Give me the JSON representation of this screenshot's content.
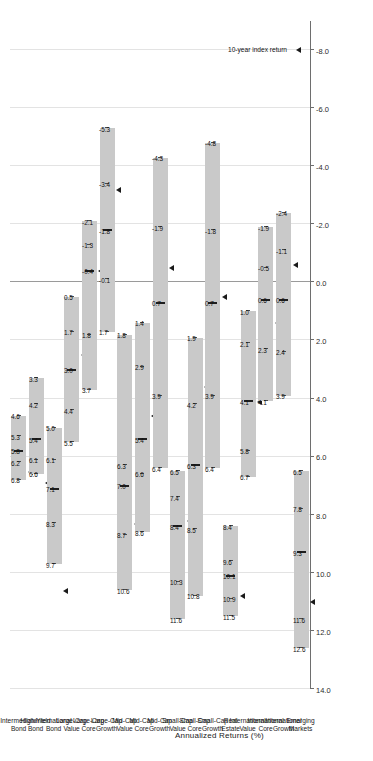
{
  "chart_data": {
    "type": "box",
    "title": "",
    "xlabel": "",
    "ylabel": "Annualized Returns (%)",
    "ylim": [
      -9.0,
      14.0
    ],
    "grid": true,
    "tick_labels": [
      "14.0",
      "12.0",
      "10.0",
      "8.0",
      "6.0",
      "4.0",
      "2.0",
      "0.0",
      "-2.0",
      "-4.0",
      "-6.0",
      "-8.0"
    ],
    "tick_values": [
      14.0,
      12.0,
      10.0,
      8.0,
      6.0,
      4.0,
      2.0,
      0.0,
      -2.0,
      -4.0,
      -6.0,
      -8.0
    ],
    "zero_line": 0.0,
    "legend": {
      "position": "bottom-right",
      "marker_symbol": "triangle",
      "entries": [
        {
          "label": "10-year index return",
          "value": -8.0
        }
      ]
    },
    "categories": [
      "Intermediate Bond",
      "High-Yield Bond",
      "International Bond",
      "Large-Cap Value",
      "Large-Cap Core",
      "Large-Cap Growth",
      "Mid-Cap Value",
      "Mid-Cap Core",
      "Mid-Cap Growth",
      "Small-Cap Value",
      "Small-Cap Core",
      "Small-Cap Growth",
      "Real Estate",
      "International Value",
      "International Core",
      "International Growth",
      "Emerging Markets"
    ],
    "quantile_names": [
      "max",
      "q3",
      "median",
      "q1",
      "min"
    ],
    "boxes": [
      {
        "category": "Intermediate Bond",
        "values": [
          6.8,
          6.2,
          5.8,
          5.3,
          4.6
        ],
        "labels": [
          "6.8",
          "6.2",
          "5.8",
          "5.3",
          "4.6"
        ],
        "index_return": 6.5
      },
      {
        "category": "High-Yield Bond",
        "values": [
          6.6,
          6.1,
          5.4,
          4.2,
          3.3
        ],
        "labels": [
          "6.6",
          "6.1",
          "5.4",
          "4.2",
          "3.3"
        ],
        "index_return": 6.9
      },
      {
        "category": "International Bond",
        "values": [
          9.7,
          8.3,
          7.1,
          6.1,
          5.0
        ],
        "labels": [
          "9.7",
          "8.3",
          "7.1",
          "6.1",
          "5.0"
        ],
        "index_return": 10.6
      },
      {
        "category": "Large-Cap Value",
        "values": [
          5.5,
          4.4,
          3.0,
          1.7,
          0.5
        ],
        "labels": [
          "5.5",
          "4.4",
          "3.0",
          "1.7",
          "0.5"
        ],
        "index_return": 2.5
      },
      {
        "category": "Large-Cap Core",
        "values": [
          3.7,
          1.8,
          -0.4,
          -1.3,
          -2.1
        ],
        "labels": [
          "3.7",
          "1.8",
          "-0.4",
          "-1.3",
          "-2.1"
        ],
        "index_return": -0.4
      },
      {
        "category": "Large-Cap Growth",
        "values": [
          1.7,
          -0.1,
          -1.8,
          -3.4,
          -5.3
        ],
        "labels": [
          "1.7",
          "-0.1",
          "-1.8",
          "-3.4",
          "-5.3"
        ],
        "index_return": -3.2
      },
      {
        "category": "Mid-Cap Value",
        "values": [
          10.6,
          8.7,
          7.0,
          6.3,
          1.8
        ],
        "labels": [
          "10.6",
          "8.7",
          "7.0",
          "6.3",
          "1.8"
        ],
        "index_return": 8.3
      },
      {
        "category": "Mid-Cap Core",
        "values": [
          8.6,
          6.6,
          5.4,
          2.9,
          1.4
        ],
        "labels": [
          "8.6",
          "6.6",
          "5.4",
          "2.9",
          "1.4"
        ],
        "index_return": 4.6
      },
      {
        "category": "Mid-Cap Growth",
        "values": [
          6.4,
          3.9,
          0.7,
          -1.9,
          -4.3
        ],
        "labels": [
          "6.4",
          "3.9",
          "0.7",
          "-1.9",
          "-4.3"
        ],
        "index_return": -0.5
      },
      {
        "category": "Small-Cap Value",
        "values": [
          11.6,
          10.3,
          8.4,
          7.4,
          6.5
        ],
        "labels": [
          "11.6",
          "10.3",
          "8.4",
          "7.4",
          "6.5"
        ],
        "index_return": 8.2
      },
      {
        "category": "Small-Cap Core",
        "values": [
          10.8,
          8.5,
          6.3,
          4.2,
          1.9
        ],
        "labels": [
          "10.8",
          "8.5",
          "6.3",
          "4.2",
          "1.9"
        ],
        "index_return": 3.6
      },
      {
        "category": "Small-Cap Growth",
        "values": [
          6.4,
          3.9,
          0.7,
          -1.8,
          -4.8
        ],
        "labels": [
          "6.4",
          "3.9",
          "0.7",
          "-1.8",
          "-4.8"
        ],
        "index_return": 0.5
      },
      {
        "category": "Real Estate",
        "values": [
          11.5,
          10.9,
          10.1,
          9.6,
          8.4
        ],
        "labels": [
          "11.5",
          "10.9",
          "10.1",
          "9.6",
          "8.4"
        ],
        "index_return": 10.8
      },
      {
        "category": "International Value",
        "values": [
          6.7,
          5.8,
          4.1,
          2.1,
          1.0
        ],
        "labels": [
          "6.7",
          "5.8",
          "4.1",
          "2.1",
          "1.0"
        ],
        "index_return": 4.1
      },
      {
        "category": "International Core",
        "values": [
          4.1,
          2.3,
          0.6,
          -0.5,
          -1.9
        ],
        "labels": [
          "4.1",
          "2.3",
          "0.6",
          "-0.5",
          "-1.9"
        ],
        "index_return": 1.4
      },
      {
        "category": "International Growth",
        "values": [
          3.9,
          2.4,
          0.6,
          -1.1,
          -2.4
        ],
        "labels": [
          "3.9",
          "2.4",
          "0.6",
          "-1.1",
          "-2.4"
        ],
        "index_return": -0.6
      },
      {
        "category": "Emerging Markets",
        "values": [
          12.6,
          11.6,
          9.3,
          7.8,
          6.5
        ],
        "labels": [
          "12.6",
          "11.6",
          "9.3",
          "7.8",
          "6.5"
        ],
        "index_return": 11.0
      }
    ],
    "colors": {
      "box_fill": "#c9c9c9",
      "tick": "#1e1e1e",
      "grid": "#e3e3e3",
      "zero_line": "#9a9a9a",
      "marker": "#1a1a1a",
      "text": "#111111"
    }
  }
}
